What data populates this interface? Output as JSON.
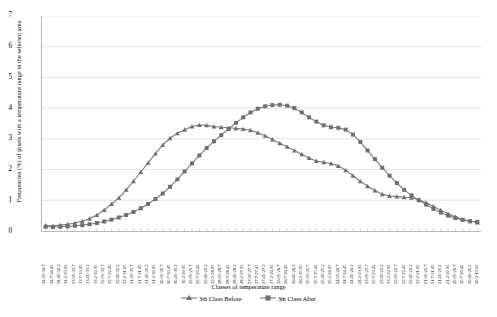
{
  "chart_data": {
    "type": "line",
    "title": "",
    "xlabel": "Classes of temperature range",
    "ylabel": "Frequencies (%) of pixels with a temperature range in the selected area",
    "ylim": [
      0,
      7
    ],
    "yticks": [
      0,
      1,
      2,
      3,
      4,
      5,
      6,
      7
    ],
    "grid": true,
    "legend_position": "bottom",
    "categories": [
      "34.95-34.7",
      "34.7-34.45",
      "34.45-34.2",
      "34.2-33.95",
      "33.95-33.7",
      "33.7-33.45",
      "33.45-33.2",
      "33.2-32.95",
      "32.95-32.7",
      "32.7-32.45",
      "32.45-32.2",
      "32.2-31.95",
      "31.95-31.7",
      "31.7-31.45",
      "31.45-31.2",
      "31.2-30.95",
      "30.95-30.7",
      "30.7-30.45",
      "30.45-30.2",
      "30.2-29.95",
      "29.95-29.7",
      "29.7-29.45",
      "29.45-29.2",
      "29.2-28.95",
      "28.95-28.7",
      "28.7-28.45",
      "28.45-28.2",
      "28.2-27.95",
      "27.95-27.7",
      "27.7-27.45",
      "27.45-27.2",
      "27.2-26.95",
      "26.95-26.7",
      "26.7-26.45",
      "26.45-26.2",
      "26.2-25.95",
      "25.95-25.7",
      "25.7-25.45",
      "25.45-25.2",
      "25.2-24.95",
      "24.95-24.7",
      "24.7-24.45",
      "24.45-24.2",
      "24.2-23.95",
      "23.95-23.7",
      "23.7-23.45",
      "23.45-23.2",
      "23.2-22.95",
      "22.95-22.7",
      "22.7-22.45",
      "22.45-22.2",
      "22.2-21.95",
      "21.95-21.7",
      "21.7-21.45",
      "21.45-21.2",
      "21.2-20.95",
      "20.95-20.7",
      "20.7-20.45",
      "20.45-20.2",
      "20.2-19.95"
    ],
    "series": [
      {
        "name": "3th Class Before",
        "marker": "triangle",
        "color": "#7b7b7b",
        "values": [
          0.18,
          0.17,
          0.19,
          0.22,
          0.26,
          0.32,
          0.4,
          0.52,
          0.68,
          0.88,
          1.08,
          1.34,
          1.62,
          1.92,
          2.22,
          2.52,
          2.8,
          3.02,
          3.18,
          3.3,
          3.4,
          3.45,
          3.44,
          3.4,
          3.38,
          3.36,
          3.34,
          3.32,
          3.28,
          3.2,
          3.1,
          2.98,
          2.86,
          2.74,
          2.62,
          2.5,
          2.38,
          2.28,
          2.24,
          2.2,
          2.12,
          1.98,
          1.8,
          1.62,
          1.46,
          1.32,
          1.2,
          1.14,
          1.12,
          1.1,
          1.08,
          1.02,
          0.92,
          0.8,
          0.68,
          0.56,
          0.46,
          0.38,
          0.32,
          0.28
        ]
      },
      {
        "name": "3th Class After",
        "marker": "square",
        "color": "#7b7b7b",
        "values": [
          0.14,
          0.13,
          0.14,
          0.15,
          0.17,
          0.19,
          0.22,
          0.26,
          0.31,
          0.37,
          0.44,
          0.52,
          0.62,
          0.74,
          0.88,
          1.04,
          1.22,
          1.44,
          1.68,
          1.94,
          2.2,
          2.46,
          2.7,
          2.92,
          3.12,
          3.32,
          3.52,
          3.7,
          3.86,
          3.98,
          4.06,
          4.1,
          4.11,
          4.08,
          4.0,
          3.86,
          3.7,
          3.56,
          3.44,
          3.38,
          3.36,
          3.3,
          3.14,
          2.9,
          2.62,
          2.34,
          2.06,
          1.8,
          1.56,
          1.34,
          1.16,
          1.0,
          0.86,
          0.72,
          0.6,
          0.5,
          0.42,
          0.36,
          0.32,
          0.3
        ]
      }
    ]
  },
  "legend": {
    "items": [
      {
        "label": "3th Class Before"
      },
      {
        "label": "3th Class After"
      }
    ]
  }
}
